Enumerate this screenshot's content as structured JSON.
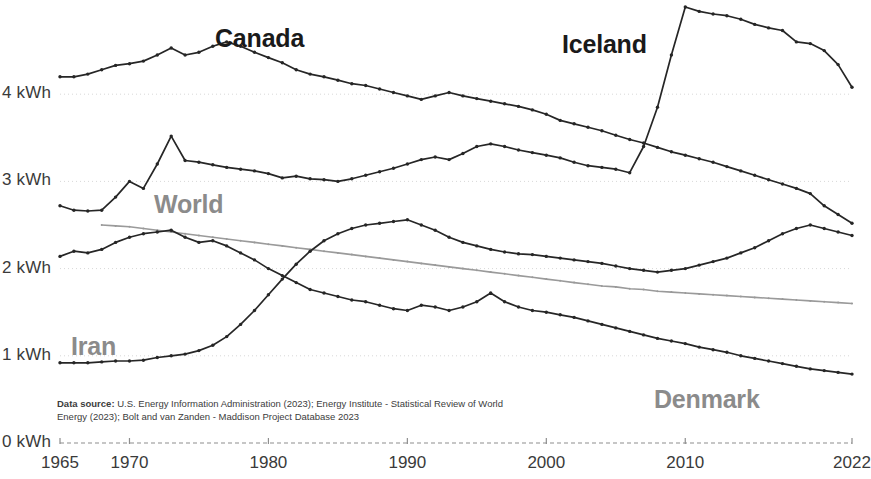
{
  "axis": {
    "y_ticks": [
      {
        "label": "0 kWh",
        "value": 0
      },
      {
        "label": "1 kWh",
        "value": 1
      },
      {
        "label": "2 kWh",
        "value": 2
      },
      {
        "label": "3 kWh",
        "value": 3
      },
      {
        "label": "4 kWh",
        "value": 4
      }
    ],
    "x_ticks": [
      {
        "label": "1965",
        "value": 1965
      },
      {
        "label": "1970",
        "value": 1970
      },
      {
        "label": "1980",
        "value": 1980
      },
      {
        "label": "1990",
        "value": 1990
      },
      {
        "label": "2000",
        "value": 2000
      },
      {
        "label": "2010",
        "value": 2010
      },
      {
        "label": "2022",
        "value": 2022
      }
    ]
  },
  "source": {
    "prefix": "Data source:",
    "text": " U.S. Energy Information Administration (2023); Energy Institute - Statistical Review of World Energy (2023); Bolt and van Zanden - Maddison Project Database 2023"
  },
  "labels": {
    "canada": "Canada",
    "iceland": "Iceland",
    "world": "World",
    "iran": "Iran",
    "denmark": "Denmark"
  },
  "colors": {
    "dark_line": "#262626",
    "gray_line": "#9a9a9a",
    "dark_label": "#1a1a1a",
    "gray_label": "#8b8b8b",
    "axis": "#8e8e8e"
  },
  "chart_data": {
    "type": "line",
    "title": "",
    "xlabel": "",
    "ylabel": "kWh",
    "xlim": [
      1965,
      2022
    ],
    "ylim": [
      0,
      5.05
    ],
    "grid": false,
    "legend": "inline-labels",
    "x": [
      1965,
      1966,
      1967,
      1968,
      1969,
      1970,
      1971,
      1972,
      1973,
      1974,
      1975,
      1976,
      1977,
      1978,
      1979,
      1980,
      1981,
      1982,
      1983,
      1984,
      1985,
      1986,
      1987,
      1988,
      1989,
      1990,
      1991,
      1992,
      1993,
      1994,
      1995,
      1996,
      1997,
      1998,
      1999,
      2000,
      2001,
      2002,
      2003,
      2004,
      2005,
      2006,
      2007,
      2008,
      2009,
      2010,
      2011,
      2012,
      2013,
      2014,
      2015,
      2016,
      2017,
      2018,
      2019,
      2020,
      2021,
      2022
    ],
    "series": [
      {
        "name": "Canada",
        "color": "#262626",
        "style": "markers-line",
        "values": [
          4.2,
          4.2,
          4.23,
          4.28,
          4.33,
          4.35,
          4.38,
          4.45,
          4.53,
          4.45,
          4.48,
          4.55,
          4.6,
          4.55,
          4.48,
          4.42,
          4.36,
          4.28,
          4.23,
          4.2,
          4.16,
          4.12,
          4.1,
          4.06,
          4.02,
          3.98,
          3.94,
          3.98,
          4.02,
          3.98,
          3.95,
          3.92,
          3.89,
          3.86,
          3.82,
          3.77,
          3.7,
          3.66,
          3.62,
          3.58,
          3.53,
          3.48,
          3.44,
          3.39,
          3.34,
          3.3,
          3.26,
          3.22,
          3.17,
          3.12,
          3.07,
          3.02,
          2.97,
          2.92,
          2.86,
          2.72,
          2.62,
          2.52
        ]
      },
      {
        "name": "Iceland",
        "color": "#262626",
        "style": "markers-line",
        "values": [
          2.72,
          2.67,
          2.66,
          2.67,
          2.82,
          3.0,
          2.92,
          3.2,
          3.52,
          3.24,
          3.22,
          3.19,
          3.16,
          3.14,
          3.12,
          3.09,
          3.04,
          3.06,
          3.03,
          3.02,
          3.0,
          3.03,
          3.07,
          3.11,
          3.15,
          3.2,
          3.25,
          3.28,
          3.25,
          3.32,
          3.4,
          3.43,
          3.4,
          3.36,
          3.33,
          3.3,
          3.27,
          3.22,
          3.18,
          3.16,
          3.14,
          3.1,
          3.4,
          3.85,
          4.45,
          5.0,
          4.95,
          4.92,
          4.9,
          4.86,
          4.8,
          4.76,
          4.73,
          4.6,
          4.58,
          4.5,
          4.34,
          4.08
        ]
      },
      {
        "name": "World",
        "color": "#9a9a9a",
        "style": "line",
        "values": [
          null,
          null,
          null,
          2.5,
          2.49,
          2.48,
          2.46,
          2.44,
          2.42,
          2.4,
          2.38,
          2.36,
          2.34,
          2.32,
          2.3,
          2.28,
          2.26,
          2.24,
          2.22,
          2.2,
          2.18,
          2.16,
          2.14,
          2.12,
          2.1,
          2.08,
          2.06,
          2.04,
          2.02,
          2.0,
          1.98,
          1.96,
          1.94,
          1.92,
          1.9,
          1.88,
          1.86,
          1.84,
          1.82,
          1.8,
          1.79,
          1.77,
          1.76,
          1.74,
          1.73,
          1.72,
          1.71,
          1.7,
          1.69,
          1.68,
          1.67,
          1.66,
          1.65,
          1.64,
          1.63,
          1.62,
          1.61,
          1.6
        ]
      },
      {
        "name": "Iran",
        "color": "#262626",
        "style": "markers-line",
        "values": [
          0.92,
          0.92,
          0.92,
          0.93,
          0.94,
          0.94,
          0.95,
          0.98,
          1.0,
          1.02,
          1.06,
          1.12,
          1.22,
          1.36,
          1.52,
          1.7,
          1.88,
          2.05,
          2.2,
          2.32,
          2.4,
          2.46,
          2.5,
          2.52,
          2.54,
          2.56,
          2.5,
          2.44,
          2.36,
          2.3,
          2.26,
          2.22,
          2.19,
          2.17,
          2.16,
          2.14,
          2.12,
          2.1,
          2.08,
          2.06,
          2.03,
          2.0,
          1.98,
          1.96,
          1.98,
          2.0,
          2.04,
          2.08,
          2.12,
          2.18,
          2.24,
          2.32,
          2.4,
          2.46,
          2.5,
          2.46,
          2.42,
          2.38
        ]
      },
      {
        "name": "Denmark",
        "color": "#262626",
        "style": "markers-line",
        "values": [
          2.14,
          2.2,
          2.18,
          2.22,
          2.3,
          2.36,
          2.4,
          2.42,
          2.44,
          2.36,
          2.3,
          2.32,
          2.26,
          2.18,
          2.1,
          2.0,
          1.92,
          1.84,
          1.76,
          1.72,
          1.68,
          1.64,
          1.62,
          1.58,
          1.54,
          1.52,
          1.58,
          1.56,
          1.52,
          1.56,
          1.62,
          1.72,
          1.62,
          1.56,
          1.52,
          1.5,
          1.47,
          1.44,
          1.4,
          1.36,
          1.32,
          1.28,
          1.24,
          1.2,
          1.17,
          1.14,
          1.1,
          1.07,
          1.04,
          1.0,
          0.97,
          0.94,
          0.91,
          0.88,
          0.85,
          0.83,
          0.81,
          0.79
        ]
      }
    ]
  }
}
